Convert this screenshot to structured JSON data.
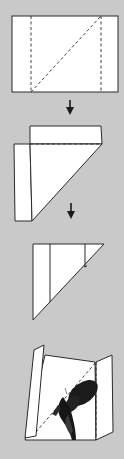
{
  "diagram": {
    "title": "Folding a paper envelope for a butterfly specimen",
    "background_color": "#c9c9c9",
    "paper_color": "#ffffff",
    "line_color": "#2a2a2a",
    "steps": [
      {
        "step": 1,
        "description": "Rectangle of paper with two vertical dashed fold lines and a diagonal dashed fold line"
      },
      {
        "step": 2,
        "description": "Side folded along vertical line, diagonal fold made; dashed horizontal fold line"
      },
      {
        "step": 3,
        "description": "Folded into triangular envelope shape"
      },
      {
        "step": 4,
        "description": "Open envelope with butterfly specimen placed along diagonal fold"
      }
    ],
    "arrows": [
      {
        "from_step": 1,
        "to_step": 2,
        "icon": "arrow-down-icon"
      },
      {
        "from_step": 2,
        "to_step": 3,
        "icon": "arrow-down-icon"
      }
    ]
  }
}
